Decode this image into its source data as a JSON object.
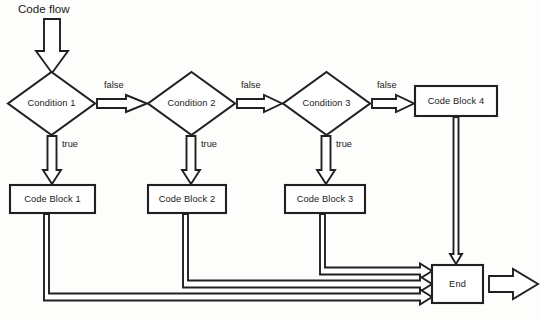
{
  "diagram": {
    "title": "Code flow",
    "type": "flowchart",
    "style": {
      "stroke_color": "#231f20",
      "fill_color": "#ffffff",
      "background_color": "#fdfdfc",
      "text_color": "#1a1a1a"
    },
    "nodes": [
      {
        "id": "condition1",
        "shape": "diamond",
        "label": "Condition 1",
        "cx": 51.5,
        "cy": 103.5,
        "rx": 44,
        "ry": 32
      },
      {
        "id": "condition2",
        "shape": "diamond",
        "label": "Condition 2",
        "cx": 191.5,
        "cy": 103.5,
        "rx": 44,
        "ry": 32
      },
      {
        "id": "condition3",
        "shape": "diamond",
        "label": "Condition 3",
        "cx": 326.5,
        "cy": 103.5,
        "rx": 44,
        "ry": 32
      },
      {
        "id": "codeblock1",
        "shape": "rect",
        "label": "Code Block 1",
        "x": 10,
        "y": 185,
        "w": 85,
        "h": 28
      },
      {
        "id": "codeblock2",
        "shape": "rect",
        "label": "Code Block 2",
        "x": 148,
        "y": 185,
        "w": 78,
        "h": 28
      },
      {
        "id": "codeblock3",
        "shape": "rect",
        "label": "Code Block 3",
        "x": 285,
        "y": 185,
        "w": 80,
        "h": 28
      },
      {
        "id": "codeblock4",
        "shape": "rect",
        "label": "Code Block 4",
        "x": 415,
        "y": 86,
        "w": 82,
        "h": 30
      },
      {
        "id": "end",
        "shape": "rect",
        "label": "End",
        "x": 432,
        "y": 265,
        "w": 51,
        "h": 38
      }
    ],
    "edges": [
      {
        "from": "start",
        "to": "condition1",
        "label": "",
        "direction": "down"
      },
      {
        "from": "condition1",
        "to": "condition2",
        "label": "false",
        "direction": "right"
      },
      {
        "from": "condition2",
        "to": "condition3",
        "label": "false",
        "direction": "right"
      },
      {
        "from": "condition3",
        "to": "codeblock4",
        "label": "false",
        "direction": "right"
      },
      {
        "from": "condition1",
        "to": "codeblock1",
        "label": "true",
        "direction": "down"
      },
      {
        "from": "condition2",
        "to": "codeblock2",
        "label": "true",
        "direction": "down"
      },
      {
        "from": "condition3",
        "to": "codeblock3",
        "label": "true",
        "direction": "down"
      },
      {
        "from": "codeblock4",
        "to": "end",
        "label": "",
        "direction": "down"
      },
      {
        "from": "codeblock3",
        "to": "end",
        "label": "",
        "direction": "elbow-right"
      },
      {
        "from": "codeblock2",
        "to": "end",
        "label": "",
        "direction": "elbow-right"
      },
      {
        "from": "codeblock1",
        "to": "end",
        "label": "",
        "direction": "elbow-right"
      },
      {
        "from": "end",
        "to": "exit",
        "label": "",
        "direction": "right"
      }
    ],
    "edge_labels": [
      {
        "text": "false",
        "x": 104,
        "y": 80
      },
      {
        "text": "false",
        "x": 241,
        "y": 80
      },
      {
        "text": "false",
        "x": 377,
        "y": 80
      },
      {
        "text": "true",
        "x": 58,
        "y": 139
      },
      {
        "text": "true",
        "x": 197,
        "y": 139
      },
      {
        "text": "true",
        "x": 332,
        "y": 139
      }
    ]
  }
}
